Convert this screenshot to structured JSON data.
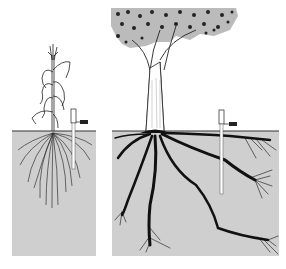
{
  "figure": {
    "colors": {
      "background": "#ffffff",
      "soil": "#cfcfcf",
      "ink": "#111111",
      "probe": "#ffffff"
    },
    "panels": [
      {
        "id": "corn",
        "label": "",
        "soil_box": [
          12,
          131,
          84,
          125
        ]
      },
      {
        "id": "tree",
        "label": "",
        "soil_box": [
          112,
          131,
          167,
          125
        ]
      }
    ]
  }
}
